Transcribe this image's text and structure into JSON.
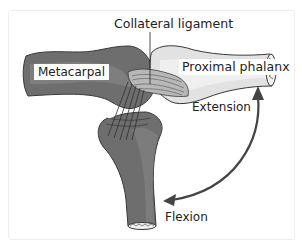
{
  "diagram": {
    "labels": {
      "collateral_ligament": "Collateral ligament",
      "metacarpal": "Metacarpal",
      "proximal_phalanx": "Proximal phalanx",
      "extension": "Extension",
      "flexion": "Flexion"
    },
    "colors": {
      "metacarpal_bone": "#6e6e6e",
      "metacarpal_highlight": "#8a8a8a",
      "phalanx_bone": "#e2e2e2",
      "phalanx_highlight": "#f4f4f4",
      "ligament": "#b8b8b8",
      "arrow": "#444444",
      "outline": "#3a3a3a"
    },
    "arrow": {
      "type": "double-headed curved",
      "from": "extension",
      "to": "flexion"
    }
  }
}
